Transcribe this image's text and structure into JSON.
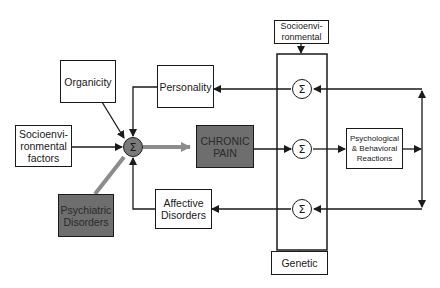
{
  "diagram": {
    "nodes": {
      "organicity": {
        "lines": [
          "Organicity"
        ]
      },
      "personality": {
        "lines": [
          "Personality"
        ]
      },
      "socio_factors": {
        "lines": [
          "Socioenvi-",
          "ronmental",
          "factors"
        ]
      },
      "chronic_pain": {
        "lines": [
          "CHRONIC",
          "PAIN"
        ]
      },
      "psychiatric": {
        "lines": [
          "Psychiatric",
          "Disorders"
        ]
      },
      "affective": {
        "lines": [
          "Affective",
          "Disorders"
        ]
      },
      "socio_top": {
        "lines": [
          "Socioenvi-",
          "ronmental"
        ]
      },
      "psych_behav": {
        "lines": [
          "Psychological",
          "& Behavioral",
          "Reactions"
        ]
      },
      "genetic": {
        "lines": [
          "Genetic"
        ]
      }
    },
    "summing_symbol": "Σ",
    "colors": {
      "line": "#1a1a1a",
      "dark_fill": "#6e6e6e",
      "gray_arrow": "#8c8c8c",
      "background": "#ffffff"
    }
  }
}
